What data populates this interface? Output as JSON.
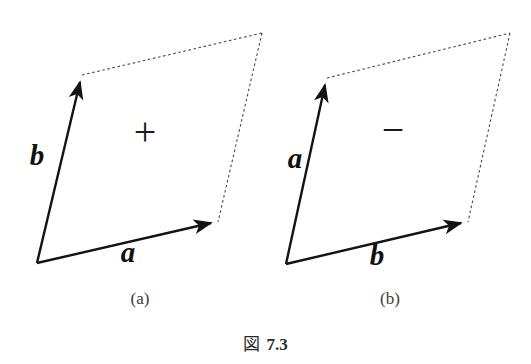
{
  "figure": {
    "caption_word": "図",
    "caption_number": "7.3",
    "background_color": "#ffffff",
    "ink_color": "#1a1a1a"
  },
  "panels": [
    {
      "id": "panel-a",
      "caption": "(a)",
      "caption_x": 140,
      "caption_y": 298,
      "sign": "+",
      "sign_x": 145,
      "sign_y": 132,
      "origin": {
        "x": 37,
        "y": 263
      },
      "corner": {
        "x": 262,
        "y": 33
      },
      "vectors": [
        {
          "name": "b",
          "label": "b",
          "label_x": 37,
          "label_y": 155,
          "tip": {
            "x": 82,
            "y": 75
          }
        },
        {
          "name": "a",
          "label": "a",
          "label_x": 128,
          "label_y": 252,
          "tip": {
            "x": 218,
            "y": 222
          }
        }
      ]
    },
    {
      "id": "panel-b",
      "caption": "(b)",
      "caption_x": 390,
      "caption_y": 298,
      "sign": "−",
      "sign_x": 393,
      "sign_y": 130,
      "origin": {
        "x": 286,
        "y": 264
      },
      "corner": {
        "x": 510,
        "y": 33
      },
      "vectors": [
        {
          "name": "a",
          "label": "a",
          "label_x": 295,
          "label_y": 158,
          "tip": {
            "x": 327,
            "y": 78
          }
        },
        {
          "name": "b",
          "label": "b",
          "label_x": 377,
          "label_y": 255,
          "tip": {
            "x": 468,
            "y": 222
          }
        }
      ]
    }
  ]
}
